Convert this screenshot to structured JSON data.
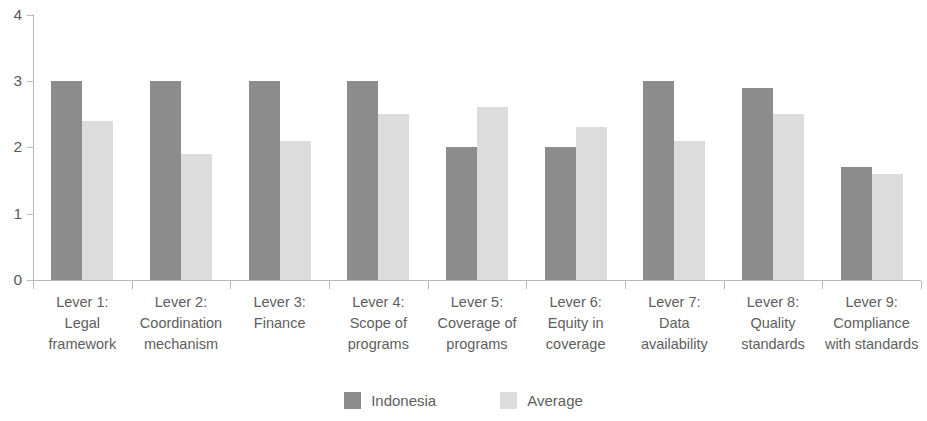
{
  "chart_data": {
    "type": "bar",
    "title": "",
    "subtitle": "",
    "xlabel": "",
    "ylabel": "",
    "ylim": [
      0,
      4
    ],
    "yticks": [
      0,
      1,
      2,
      3,
      4
    ],
    "ytick_labels": [
      "0",
      "1",
      "2",
      "3",
      "4"
    ],
    "grid": false,
    "legend_position": "bottom-center",
    "categories": [
      "Lever 1: Legal framework",
      "Lever 2: Coordination mechanism",
      "Lever 3: Finance",
      "Lever 4: Scope of programs",
      "Lever 5: Coverage of programs",
      "Lever 6: Equity in coverage",
      "Lever 7: Data availability",
      "Lever 8: Quality standards",
      "Lever 9: Compliance with standards"
    ],
    "category_lines": [
      [
        "Lever 1:",
        "Legal",
        "framework"
      ],
      [
        "Lever 2:",
        "Coordination",
        "mechanism"
      ],
      [
        "Lever 3:",
        "Finance"
      ],
      [
        "Lever 4:",
        "Scope of",
        "programs"
      ],
      [
        "Lever 5:",
        "Coverage of",
        "programs"
      ],
      [
        "Lever 6:",
        "Equity in",
        "coverage"
      ],
      [
        "Lever 7:",
        "Data",
        "availability"
      ],
      [
        "Lever 8:",
        "Quality",
        "standards"
      ],
      [
        "Lever 9:",
        "Compliance",
        "with standards"
      ]
    ],
    "series": [
      {
        "name": "Indonesia",
        "color": "#8c8c8c",
        "values": [
          3.0,
          3.0,
          3.0,
          3.0,
          2.0,
          2.0,
          3.0,
          2.9,
          1.7
        ]
      },
      {
        "name": "Average",
        "color": "#dcdcdc",
        "values": [
          2.4,
          1.9,
          2.1,
          2.5,
          2.6,
          2.3,
          2.1,
          2.5,
          1.6
        ]
      }
    ]
  },
  "legend": {
    "items": [
      {
        "label": "Indonesia",
        "swatch": "series-indonesia"
      },
      {
        "label": "Average",
        "swatch": "series-average"
      }
    ]
  },
  "axis": {
    "baseline_color": "#b9b9b9",
    "tick_color": "#b9b9b9",
    "text_color": "#5e5e5e"
  }
}
